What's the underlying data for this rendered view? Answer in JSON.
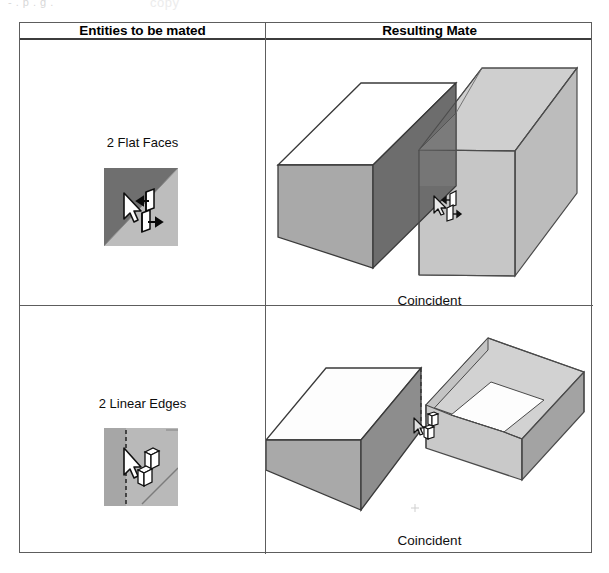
{
  "page": {
    "scrap_text_left": "- . p . g .",
    "scrap_text_center": "copy"
  },
  "table": {
    "headers": {
      "entities": "Entities to be mated",
      "result": "Resulting Mate"
    },
    "rows": [
      {
        "entity_label": "2 Flat Faces",
        "entity_icon_name": "two-flat-faces-icon",
        "result_caption": "Coincident",
        "figure_name": "coincident-faces-figure"
      },
      {
        "entity_label": "2 Linear Edges",
        "entity_icon_name": "two-linear-edges-icon",
        "result_caption": "Coincident",
        "figure_name": "coincident-edges-figure"
      }
    ]
  },
  "colors": {
    "border": "#5d5d5d",
    "header_rule": "#3c3c3c",
    "box_top_white": "#ffffff",
    "box_front_gray": "#a9a9a9",
    "box_side_dark": "#6e6e6e",
    "box_ghost_light": "#c9c9c9",
    "box_ghost_mid": "#bdbdbd",
    "icon_dark": "#6b6b6b",
    "icon_light": "#b8b8b8",
    "outline": "#303030",
    "text": "#000000"
  }
}
